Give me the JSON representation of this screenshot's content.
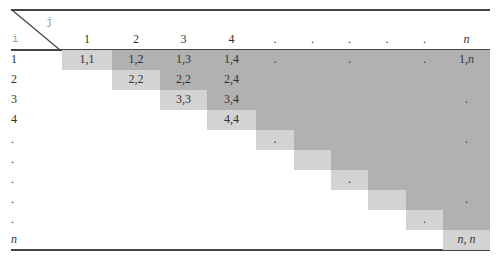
{
  "corner": {
    "row_symbol": "i",
    "col_symbol": "j"
  },
  "columns": [
    {
      "label": "1",
      "x": 62,
      "w": 50
    },
    {
      "label": "2",
      "x": 112,
      "w": 48
    },
    {
      "label": "3",
      "x": 160,
      "w": 47
    },
    {
      "label": "4",
      "x": 207,
      "w": 49
    },
    {
      "label": ".",
      "x": 256,
      "w": 38
    },
    {
      "label": ".",
      "x": 294,
      "w": 37
    },
    {
      "label": ".",
      "x": 331,
      "w": 37
    },
    {
      "label": ".",
      "x": 368,
      "w": 38
    },
    {
      "label": ".",
      "x": 406,
      "w": 37
    },
    {
      "label": "n",
      "x": 443,
      "w": 47
    }
  ],
  "rows": [
    "1",
    "2",
    "3",
    "4",
    ".",
    ".",
    ".",
    ".",
    ".",
    "n"
  ],
  "cells": [
    {
      "r": 0,
      "c": 0,
      "t": "1,1"
    },
    {
      "r": 0,
      "c": 1,
      "t": "1,2"
    },
    {
      "r": 0,
      "c": 2,
      "t": "1,3"
    },
    {
      "r": 0,
      "c": 3,
      "t": "1,4"
    },
    {
      "r": 0,
      "c": 4,
      "t": "."
    },
    {
      "r": 0,
      "c": 6,
      "t": "."
    },
    {
      "r": 0,
      "c": 8,
      "t": "."
    },
    {
      "r": 0,
      "c": 9,
      "t": "1,n"
    },
    {
      "r": 1,
      "c": 1,
      "t": "2,2"
    },
    {
      "r": 1,
      "c": 2,
      "t": "2,2"
    },
    {
      "r": 1,
      "c": 3,
      "t": "2,4"
    },
    {
      "r": 2,
      "c": 2,
      "t": "3,3"
    },
    {
      "r": 2,
      "c": 3,
      "t": "3,4"
    },
    {
      "r": 2,
      "c": 9,
      "t": "."
    },
    {
      "r": 3,
      "c": 3,
      "t": "4,4"
    },
    {
      "r": 4,
      "c": 4,
      "t": "."
    },
    {
      "r": 4,
      "c": 9,
      "t": "."
    },
    {
      "r": 6,
      "c": 6,
      "t": "."
    },
    {
      "r": 7,
      "c": 9,
      "t": "."
    },
    {
      "r": 8,
      "c": 8,
      "t": "."
    },
    {
      "r": 9,
      "c": 9,
      "t": "n, n"
    }
  ],
  "colors": {
    "diagonal": "#d3d3d3",
    "upper": "#b1b1b1",
    "rule": "#444444"
  }
}
